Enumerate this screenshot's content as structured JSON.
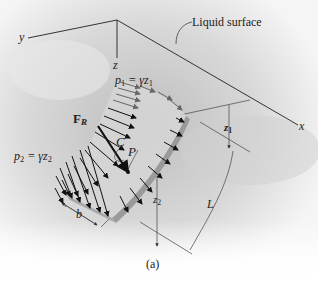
{
  "figure": {
    "caption": "(a)",
    "annotation": "Liquid surface",
    "axes": {
      "x": "x",
      "y": "y",
      "z": "z"
    },
    "forces": {
      "resultant": "F",
      "resultant_sub": "R",
      "centroid": "C",
      "point": "P"
    },
    "pressures": {
      "top": {
        "p": "p",
        "sub": "1",
        "eq": " = γz",
        "zsub": "1"
      },
      "bottom": {
        "p": "p",
        "sub": "2",
        "eq": " = γz",
        "zsub": "2"
      }
    },
    "dimensions": {
      "z1": "z",
      "z1_sub": "1",
      "z2": "z",
      "z2_sub": "2",
      "width": "b",
      "length": "L"
    },
    "colors": {
      "background_light": "#f2f2f2",
      "background_shade": "#c8c8c8",
      "plate_face": "#d9d9d9",
      "plate_edge": "#9a9a9a",
      "arrow": "#111111",
      "line": "#333333"
    }
  }
}
